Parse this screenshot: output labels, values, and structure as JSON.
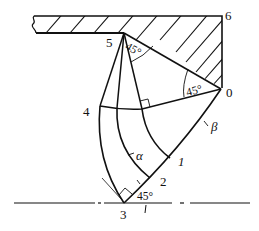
{
  "diagram": {
    "points": [
      {
        "id": "0",
        "label": "0"
      },
      {
        "id": "1",
        "label": "1"
      },
      {
        "id": "2",
        "label": "2"
      },
      {
        "id": "3",
        "label": "3"
      },
      {
        "id": "4",
        "label": "4"
      },
      {
        "id": "5",
        "label": "5"
      },
      {
        "id": "6",
        "label": "6"
      }
    ],
    "angles": {
      "at_5": "45°",
      "at_0": "45°",
      "at_3": "45°"
    },
    "curve_labels": {
      "alpha": "α",
      "beta": "β"
    },
    "colors": {
      "ink": "#111111",
      "background": "#ffffff"
    }
  }
}
